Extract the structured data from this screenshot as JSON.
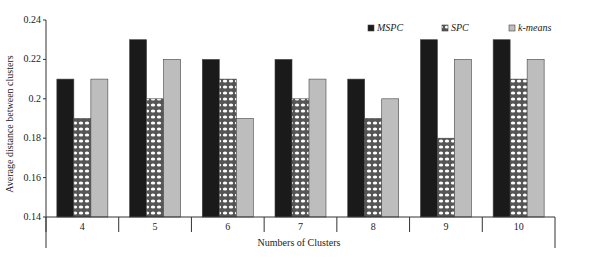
{
  "chart_data": {
    "type": "bar",
    "title": "",
    "xlabel": "Numbers of Clusters",
    "ylabel": "Average distance between clusters",
    "categories": [
      "4",
      "5",
      "6",
      "7",
      "8",
      "9",
      "10"
    ],
    "series": [
      {
        "name": "MSPC",
        "values": [
          0.21,
          0.23,
          0.22,
          0.22,
          0.21,
          0.23,
          0.23
        ],
        "color": "#1a1a1a",
        "pattern": "solid"
      },
      {
        "name": "SPC",
        "values": [
          0.19,
          0.2,
          0.21,
          0.2,
          0.19,
          0.18,
          0.21
        ],
        "color": "#ffffff",
        "pattern": "checker"
      },
      {
        "name": "k-means",
        "values": [
          0.21,
          0.22,
          0.19,
          0.21,
          0.2,
          0.22,
          0.22
        ],
        "color": "#bdbdbd",
        "pattern": "solid"
      }
    ],
    "ylim": [
      0.14,
      0.24
    ],
    "yticks": [
      "0.14",
      "0.16",
      "0.18",
      "0.2",
      "0.22",
      "0.24"
    ],
    "grid": false,
    "legend_position": "top-right"
  }
}
